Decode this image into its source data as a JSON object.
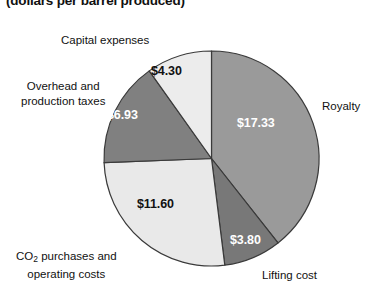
{
  "chart_data": {
    "type": "pie",
    "title": "",
    "subtitle": "(dollars per barrel produced)",
    "unit": "dollars per barrel produced",
    "total": 44.0,
    "legend_position": "callouts-around-pie",
    "grid": false,
    "start_angle_deg": 0,
    "direction": "clockwise",
    "categories": [
      "Royalty",
      "Lifting cost",
      "CO2 purchases and operating costs",
      "Overhead and production taxes",
      "Capital expenses"
    ],
    "values": [
      17.33,
      3.8,
      11.6,
      6.93,
      4.3
    ],
    "value_labels": [
      "$17.33",
      "$3.80",
      "$11.60",
      "$6.93",
      "$4.30"
    ],
    "colors": [
      "#9a9a9a",
      "#787878",
      "#e9e9e9",
      "#808080",
      "#ececec"
    ],
    "slices": [
      {
        "label": "Royalty",
        "label_line1": "Royalty",
        "label_line2": "",
        "value": 17.33,
        "value_label": "$17.33",
        "color": "#9a9a9a",
        "label_color": "#ffffff",
        "start_deg": 0.0,
        "end_deg": 141.8
      },
      {
        "label": "Lifting cost",
        "label_line1": "Lifting cost",
        "label_line2": "",
        "value": 3.8,
        "value_label": "$3.80",
        "color": "#787878",
        "label_color": "#ffffff",
        "start_deg": 141.8,
        "end_deg": 172.9
      },
      {
        "label": "CO2 purchases and operating costs",
        "label_line1": "CO₂ purchases and",
        "label_line2": "operating costs",
        "value": 11.6,
        "value_label": "$11.60",
        "color": "#e9e9e9",
        "label_color": "#111111",
        "start_deg": 172.9,
        "end_deg": 267.8
      },
      {
        "label": "Overhead and production taxes",
        "label_line1": "Overhead and",
        "label_line2": "production taxes",
        "value": 6.93,
        "value_label": "$6.93",
        "color": "#808080",
        "label_color": "#ffffff",
        "start_deg": 267.8,
        "end_deg": 324.6
      },
      {
        "label": "Capital expenses",
        "label_line1": "Capital expenses",
        "label_line2": "",
        "value": 4.3,
        "value_label": "$4.30",
        "color": "#ececec",
        "label_color": "#111111",
        "start_deg": 324.6,
        "end_deg": 360.0
      }
    ]
  },
  "callouts": {
    "capital": "Capital expenses",
    "overhead_line1": "Overhead and",
    "overhead_line2": "production taxes",
    "royalty": "Royalty",
    "co2_line1_pre": "CO",
    "co2_line1_sub": "2",
    "co2_line1_post": " purchases and",
    "co2_line2": "operating costs",
    "lifting": "Lifting cost"
  },
  "values": {
    "capital": "$4.30",
    "overhead": "$6.93",
    "royalty": "$17.33",
    "co2": "$11.60",
    "lifting": "$3.80"
  },
  "style": {
    "stroke": "#3a3a3a",
    "background": "#ffffff"
  }
}
